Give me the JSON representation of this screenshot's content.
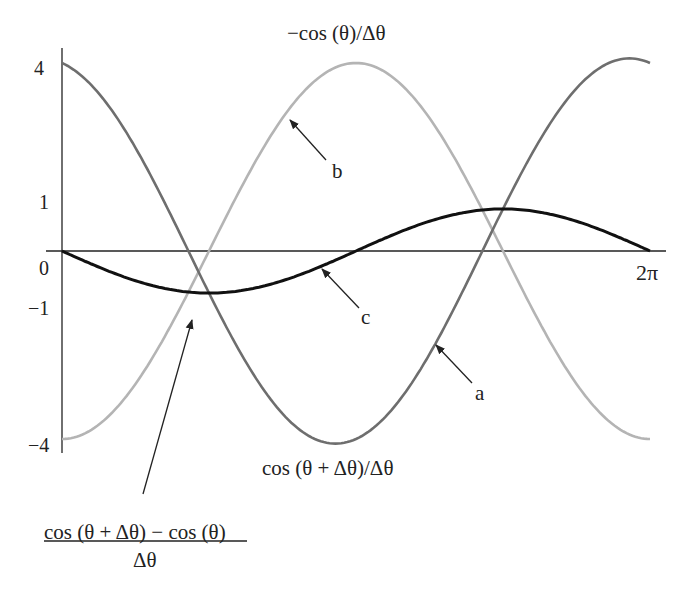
{
  "chart_data": {
    "type": "line",
    "title": "",
    "xlabel": "",
    "ylabel": "",
    "x_range": [
      0,
      6.283
    ],
    "ylim": [
      -4,
      4
    ],
    "grid": false,
    "x_tick_labels": [
      "0",
      "2π"
    ],
    "y_tick_labels": [
      "4",
      "1",
      "0",
      "−1",
      "−4"
    ],
    "series": [
      {
        "name": "a",
        "label": "cos (θ + Δθ) / Δθ",
        "color": "#6e6e6e",
        "description": "cosine of amplitude ~4, starts at 4, minimum -4 near θ≈π",
        "points": [
          [
            0,
            4.0
          ],
          [
            1.571,
            -0.5
          ],
          [
            3.0,
            -4.0
          ],
          [
            4.712,
            0.5
          ],
          [
            5.98,
            4.1
          ],
          [
            6.283,
            3.9
          ]
        ]
      },
      {
        "name": "b",
        "label": "−cos (θ) / Δθ",
        "color": "#b4b4b4",
        "description": "negative cosine of amplitude 4, starts at -4, peak 4 at θ=π",
        "points": [
          [
            0,
            -4.0
          ],
          [
            1.571,
            0.0
          ],
          [
            3.1416,
            4.0
          ],
          [
            4.712,
            0.0
          ],
          [
            6.283,
            -4.0
          ]
        ]
      },
      {
        "name": "c",
        "label": "(cos (θ + Δθ) − cos (θ)) / Δθ",
        "color": "#111111",
        "description": "sum of a and b: small-amplitude sinusoid (~ -sin θ)",
        "points": [
          [
            0,
            0.0
          ],
          [
            1.45,
            -0.9
          ],
          [
            2.8,
            0.0
          ],
          [
            4.5,
            1.2
          ],
          [
            6.283,
            0.0
          ]
        ]
      }
    ],
    "annotations": [
      {
        "text": "a",
        "target_series": "a"
      },
      {
        "text": "b",
        "target_series": "b"
      },
      {
        "text": "c",
        "target_series": "c"
      }
    ]
  },
  "labels": {
    "top": "−cos (θ)/Δθ",
    "bottom": "cos (θ + Δθ)/Δθ",
    "fraction_numerator": "cos (θ + Δθ) − cos (θ)",
    "fraction_denominator": "Δθ",
    "arrow_a": "a",
    "arrow_b": "b",
    "arrow_c": "c",
    "tick_4": "4",
    "tick_1": "1",
    "tick_0": "0",
    "tick_neg1": "−1",
    "tick_neg4": "−4",
    "tick_2pi": "2π"
  }
}
